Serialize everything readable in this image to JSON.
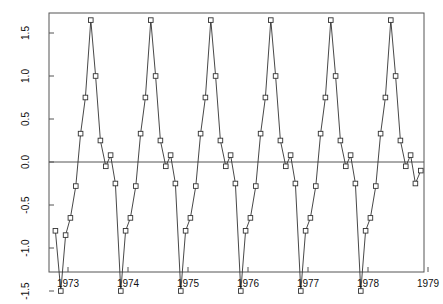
{
  "chart_data": {
    "type": "line",
    "title": "",
    "subtitle": "",
    "xlabel": "",
    "ylabel": "(thousands)",
    "grid": false,
    "legend": false,
    "legend_position": "none",
    "marker": "open-square",
    "line_color": "#333333",
    "marker_color": "#333333",
    "background_color": "#ffffff",
    "frame_color": "#555555",
    "zero_line": 0.0,
    "xlim": [
      1972.75,
      1979.2
    ],
    "ylim": [
      -1.55,
      1.78
    ],
    "y_ticks": [
      1.5,
      1.0,
      0.5,
      0.0,
      -0.5,
      -1.0,
      -1.5
    ],
    "y_tick_labels": [
      "1.5",
      "1.0",
      "0.5",
      "0.0",
      "-0.5",
      "-1.0",
      "-1.5"
    ],
    "x_ticks": [
      1973,
      1974,
      1975,
      1976,
      1977,
      1978,
      1979
    ],
    "x_tick_labels": [
      "1973",
      "1974",
      "1975",
      "1976",
      "1977",
      "1978",
      "1979"
    ],
    "series": [
      {
        "name": "series-1",
        "x": [
          1972.79,
          1972.88,
          1972.96,
          1973.04,
          1973.13,
          1973.21,
          1973.29,
          1973.38,
          1973.46,
          1973.54,
          1973.63,
          1973.71,
          1973.79,
          1973.88,
          1973.96,
          1974.04,
          1974.13,
          1974.21,
          1974.29,
          1974.38,
          1974.46,
          1974.54,
          1974.63,
          1974.71,
          1974.79,
          1974.88,
          1974.96,
          1975.04,
          1975.13,
          1975.21,
          1975.29,
          1975.38,
          1975.46,
          1975.54,
          1975.63,
          1975.71,
          1975.79,
          1975.88,
          1975.96,
          1976.04,
          1976.13,
          1976.21,
          1976.29,
          1976.38,
          1976.46,
          1976.54,
          1976.63,
          1976.71,
          1976.79,
          1976.88,
          1976.96,
          1977.04,
          1977.13,
          1977.21,
          1977.29,
          1977.38,
          1977.46,
          1977.54,
          1977.63,
          1977.71,
          1977.79,
          1977.88,
          1977.96,
          1978.04,
          1978.13,
          1978.21,
          1978.29,
          1978.38,
          1978.46,
          1978.54,
          1978.63,
          1978.71,
          1978.79,
          1978.88
        ],
        "values": [
          -0.8,
          -1.5,
          -0.85,
          -0.65,
          -0.28,
          0.33,
          0.75,
          1.65,
          1.0,
          0.25,
          -0.05,
          0.08,
          -0.25,
          -1.5,
          -0.8,
          -0.65,
          -0.28,
          0.33,
          0.75,
          1.65,
          1.0,
          0.25,
          -0.05,
          0.08,
          -0.25,
          -1.5,
          -0.8,
          -0.65,
          -0.28,
          0.33,
          0.75,
          1.65,
          1.0,
          0.25,
          -0.05,
          0.08,
          -0.25,
          -1.5,
          -0.8,
          -0.65,
          -0.28,
          0.33,
          0.75,
          1.65,
          1.0,
          0.25,
          -0.05,
          0.08,
          -0.25,
          -1.5,
          -0.8,
          -0.65,
          -0.28,
          0.33,
          0.75,
          1.65,
          1.0,
          0.25,
          -0.05,
          0.08,
          -0.25,
          -1.5,
          -0.8,
          -0.65,
          -0.28,
          0.33,
          0.75,
          1.65,
          1.0,
          0.25,
          -0.05,
          0.08,
          -0.25,
          -0.1
        ]
      }
    ]
  },
  "axes": {
    "y_title": "(thousands)"
  }
}
